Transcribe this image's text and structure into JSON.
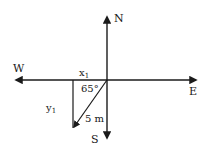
{
  "diagram": {
    "type": "vector-compass-diagram",
    "directions": {
      "north": "N",
      "south": "S",
      "east": "E",
      "west": "W"
    },
    "components": {
      "x": "x",
      "x_sub": "1",
      "y": "y",
      "y_sub": "1"
    },
    "angle": "65°",
    "magnitude": "5 m",
    "colors": {
      "stroke": "#1a1a1a",
      "background": "#ffffff"
    }
  }
}
